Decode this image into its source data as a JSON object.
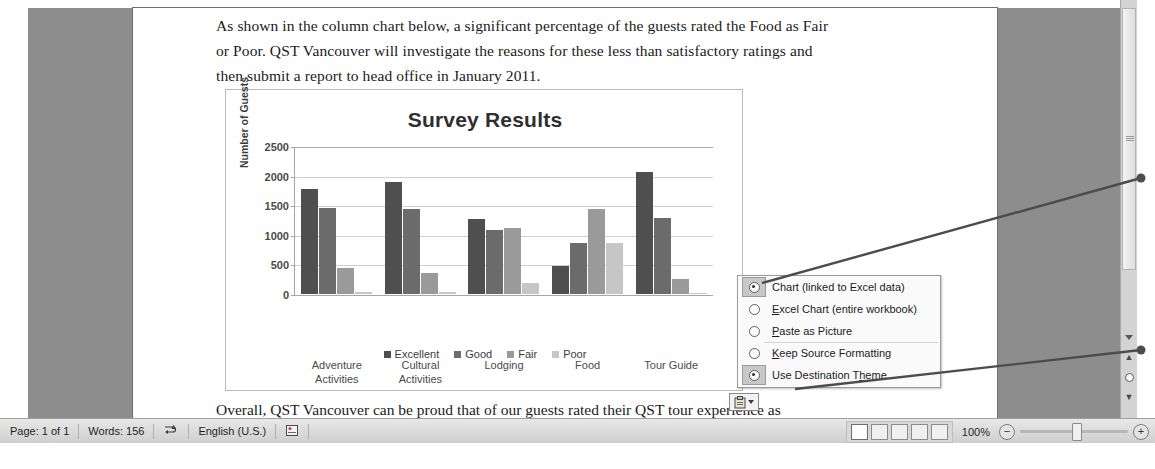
{
  "document": {
    "paragraph_top": [
      "As shown in the column chart below, a significant percentage of the guests rated the Food as Fair",
      "or Poor. QST Vancouver will investigate the reasons for these less than satisfactory ratings and",
      "then submit a report to head office in January 2011."
    ],
    "paragraph_bottom": "Overall, QST Vancouver can be proud that of our guests rated their QST tour experience as"
  },
  "chart_data": {
    "type": "bar",
    "title": "Survey Results",
    "xlabel": "",
    "ylabel": "Number of Guests",
    "ylim": [
      0,
      2500
    ],
    "yticks": [
      0,
      500,
      1000,
      1500,
      2000,
      2500
    ],
    "grid": true,
    "legend_position": "bottom",
    "categories": [
      "Adventure Activities",
      "Cultural Activities",
      "Lodging",
      "Food",
      "Tour Guide"
    ],
    "series": [
      {
        "name": "Excellent",
        "color": "#4f4f4f",
        "values": [
          1780,
          1890,
          1270,
          470,
          2060
        ]
      },
      {
        "name": "Good",
        "color": "#6b6b6b",
        "values": [
          1460,
          1430,
          1080,
          870,
          1290
        ]
      },
      {
        "name": "Fair",
        "color": "#9a9a9a",
        "values": [
          440,
          360,
          1120,
          1430,
          250
        ]
      },
      {
        "name": "Poor",
        "color": "#c6c6c6",
        "values": [
          40,
          30,
          180,
          860,
          20
        ]
      }
    ]
  },
  "paste_menu": {
    "items": [
      {
        "label": "Chart (linked to Excel data)",
        "selected": true,
        "accel": ""
      },
      {
        "label": "Excel Chart (entire workbook)",
        "selected": false,
        "accel": "E"
      },
      {
        "label": "Paste as Picture",
        "selected": false,
        "accel": "P"
      },
      {
        "label": "Keep Source Formatting",
        "selected": false,
        "accel": "K"
      },
      {
        "label": "Use Destination Theme",
        "selected": true,
        "accel": "h"
      }
    ]
  },
  "paste_button": {
    "icon": "clipboard-icon",
    "dropdown_icon": "caret-down-icon"
  },
  "status_bar": {
    "page": "Page: 1 of 1",
    "words": "Words: 156",
    "proofing_icon": "spellcheck-icon",
    "language": "English (U.S.)",
    "macro_icon": "record-macro-icon",
    "zoom_level": "100%",
    "zoom_out_label": "−",
    "zoom_in_label": "+",
    "view_buttons": [
      "print-layout",
      "full-screen-reading",
      "web-layout",
      "outline",
      "draft"
    ]
  },
  "scrollbar": {
    "previous_page_icon": "double-up-arrow",
    "select_browse_object_icon": "browse-object-circle",
    "next_page_icon": "double-down-arrow",
    "scroll_down_icon": "triangle-down"
  }
}
